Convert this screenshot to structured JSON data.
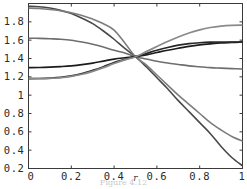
{
  "figure": {
    "kind": "mathematica-plot",
    "width": 247,
    "height": 189,
    "background": "#ffffff",
    "frame_color": "#3a3a3a",
    "caption_partial": "Figure 4.12"
  },
  "chart_data": {
    "type": "line",
    "title": "",
    "subtitle": "",
    "xlabel": "r",
    "ylabel": "",
    "xlim": [
      0,
      1
    ],
    "ylim": [
      0.2,
      2.0
    ],
    "grid": false,
    "legend": null,
    "legend_position": "none",
    "xticks": [
      0,
      0.2,
      0.4,
      0.6,
      0.8,
      1
    ],
    "xtick_labels": [
      "0",
      "0.2",
      "0.4",
      "0.6",
      "0.8",
      "1"
    ],
    "yticks": [
      0.2,
      0.4,
      0.6,
      0.8,
      1.0,
      1.2,
      1.4,
      1.6,
      1.8
    ],
    "ytick_labels": [
      "0.2",
      "0.4",
      "0.6",
      "0.8",
      "1",
      "1.2",
      "1.4",
      "1.6",
      "1.8"
    ],
    "x": [
      0,
      0.05,
      0.1,
      0.15,
      0.2,
      0.25,
      0.3,
      0.35,
      0.4,
      0.45,
      0.5,
      0.55,
      0.6,
      0.65,
      0.7,
      0.75,
      0.8,
      0.85,
      0.9,
      0.95,
      1
    ],
    "crossing_point": [
      0.5,
      1.42
    ],
    "annotations": [],
    "series": [
      {
        "name": "curve-1-falling-steep",
        "color": "#4a4a4a",
        "width": 1.6,
        "values": [
          1.97,
          1.965,
          1.95,
          1.925,
          1.89,
          1.84,
          1.78,
          1.7,
          1.61,
          1.51,
          1.42,
          1.31,
          1.19,
          1.07,
          0.94,
          0.82,
          0.7,
          0.58,
          0.44,
          0.32,
          0.23
        ]
      },
      {
        "name": "curve-2-falling-mid",
        "color": "#7d7d7d",
        "width": 1.6,
        "values": [
          1.95,
          1.945,
          1.935,
          1.92,
          1.9,
          1.87,
          1.83,
          1.78,
          1.71,
          1.57,
          1.42,
          1.33,
          1.22,
          1.11,
          1.0,
          0.9,
          0.8,
          0.7,
          0.62,
          0.55,
          0.5
        ]
      },
      {
        "name": "curve-3-falling-shallow",
        "color": "#6e6e6e",
        "width": 1.6,
        "values": [
          1.62,
          1.62,
          1.615,
          1.61,
          1.6,
          1.58,
          1.555,
          1.525,
          1.49,
          1.46,
          1.42,
          1.395,
          1.37,
          1.35,
          1.335,
          1.32,
          1.31,
          1.3,
          1.295,
          1.29,
          1.285
        ]
      },
      {
        "name": "curve-4-rising-shallow",
        "color": "#1c1c1c",
        "width": 1.7,
        "values": [
          1.3,
          1.302,
          1.306,
          1.312,
          1.32,
          1.333,
          1.35,
          1.372,
          1.394,
          1.408,
          1.42,
          1.44,
          1.465,
          1.49,
          1.512,
          1.532,
          1.548,
          1.56,
          1.57,
          1.575,
          1.58
        ]
      },
      {
        "name": "curve-5-rising-mid",
        "color": "#272727",
        "width": 1.7,
        "values": [
          1.18,
          1.182,
          1.186,
          1.194,
          1.21,
          1.235,
          1.27,
          1.31,
          1.355,
          1.39,
          1.42,
          1.455,
          1.49,
          1.52,
          1.545,
          1.562,
          1.572,
          1.578,
          1.58,
          1.58,
          1.58
        ]
      },
      {
        "name": "curve-6-rising-steep",
        "color": "#8a8a8a",
        "width": 1.7,
        "values": [
          1.18,
          1.181,
          1.183,
          1.19,
          1.205,
          1.228,
          1.26,
          1.3,
          1.345,
          1.385,
          1.42,
          1.475,
          1.53,
          1.585,
          1.635,
          1.678,
          1.712,
          1.738,
          1.754,
          1.762,
          1.765
        ]
      }
    ]
  }
}
